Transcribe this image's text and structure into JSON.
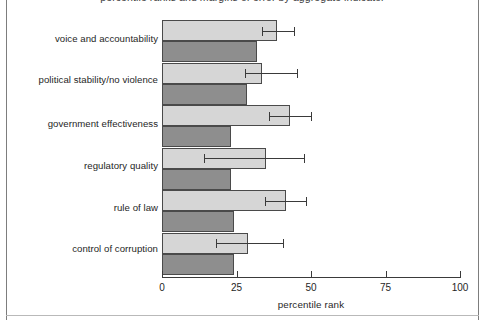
{
  "figure": {
    "title_clipped": "percentile ranks and margins of error by aggregate indicator",
    "frame_color": "#7d7d7d"
  },
  "chart_data": {
    "type": "bar",
    "orientation": "horizontal",
    "title": "percentile ranks and margins of error by aggregate indicator",
    "xlabel": "percentile rank",
    "ylabel": "",
    "xlim": [
      0,
      100
    ],
    "xticks": [
      0,
      25,
      50,
      75,
      100
    ],
    "xticklabels": [
      "0",
      "25",
      "50",
      "75",
      "100"
    ],
    "grid": false,
    "legend": null,
    "categories": [
      "voice and accountability",
      "political stability/no violence",
      "government effectiveness",
      "regulatory quality",
      "rule of law",
      "control of corruption"
    ],
    "series": [
      {
        "name": "light",
        "color": "#d6d6d6",
        "values": [
          38.5,
          33.5,
          43.0,
          35.0,
          41.5,
          29.0
        ],
        "error_low": [
          33.5,
          28.0,
          36.0,
          14.0,
          34.5,
          18.0
        ],
        "error_high": [
          44.5,
          45.5,
          50.5,
          48.0,
          48.5,
          41.0
        ]
      },
      {
        "name": "dark",
        "color": "#8e8e8e",
        "values": [
          32.0,
          28.5,
          23.0,
          23.0,
          24.0,
          24.0
        ],
        "error_low": null,
        "error_high": null
      }
    ]
  },
  "axis": {
    "x_label": "percentile rank",
    "tick_0": "0",
    "tick_25": "25",
    "tick_50": "50",
    "tick_75": "75",
    "tick_100": "100"
  },
  "labels": {
    "c0": "voice and accountability",
    "c1": "political stability/no violence",
    "c2": "government effectiveness",
    "c3": "regulatory quality",
    "c4": "rule of law",
    "c5": "control of corruption"
  }
}
